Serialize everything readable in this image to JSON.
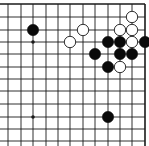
{
  "board": {
    "type": "go-board-diagram",
    "region": "top-right corner",
    "colors": {
      "background": "#ffffff",
      "line": "#1a1a1a",
      "black_stone": "#0a0a0a",
      "white_stone": "#ffffff",
      "white_stone_border": "#1a1a1a"
    },
    "grid": {
      "x": [
        8,
        21,
        33,
        46,
        58,
        70,
        83,
        95,
        108,
        120,
        132,
        145
      ],
      "y": [
        4,
        17,
        30,
        42,
        54,
        67,
        79,
        91,
        104,
        117,
        129,
        141
      ],
      "top_edge": true,
      "right_edge": true
    },
    "star_points": [
      {
        "col": 2,
        "row": 3
      },
      {
        "col": 2,
        "row": 9
      }
    ],
    "stones": [
      {
        "color": "black",
        "col": 2,
        "row": 2
      },
      {
        "color": "white",
        "col": 6,
        "row": 2
      },
      {
        "color": "white",
        "col": 5,
        "row": 3
      },
      {
        "color": "white",
        "col": 10,
        "row": 1
      },
      {
        "color": "white",
        "col": 9,
        "row": 2
      },
      {
        "color": "white",
        "col": 10,
        "row": 2
      },
      {
        "color": "black",
        "col": 8,
        "row": 3
      },
      {
        "color": "black",
        "col": 9,
        "row": 3
      },
      {
        "color": "white",
        "col": 10,
        "row": 3
      },
      {
        "color": "black",
        "col": 11,
        "row": 3
      },
      {
        "color": "black",
        "col": 7,
        "row": 4
      },
      {
        "color": "black",
        "col": 9,
        "row": 4
      },
      {
        "color": "black",
        "col": 10,
        "row": 4
      },
      {
        "color": "black",
        "col": 8,
        "row": 5
      },
      {
        "color": "white",
        "col": 9,
        "row": 5
      },
      {
        "color": "black",
        "col": 8,
        "row": 9
      }
    ]
  }
}
